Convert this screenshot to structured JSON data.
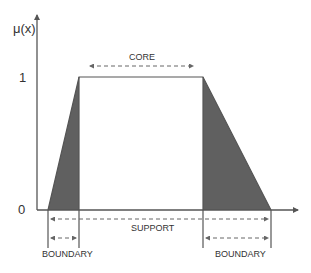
{
  "diagram": {
    "y_axis_label": "μ(x)",
    "y_ticks": [
      "1",
      "0"
    ],
    "labels": {
      "core": "CORE",
      "support": "SUPPORT",
      "boundary_left": "BOUNDARY",
      "boundary_right": "BOUNDARY"
    },
    "shape": "trapezoid",
    "colors": {
      "axis": "#555555",
      "shaded": "#606060",
      "outline": "#555555",
      "text": "#333333"
    }
  }
}
